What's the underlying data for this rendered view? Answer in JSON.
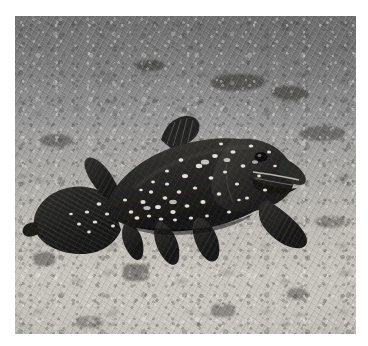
{
  "page": {
    "type": "photograph",
    "orientation": "landscape",
    "color_mode": "grayscale",
    "background_color": "#ffffff"
  },
  "photo": {
    "alt": "Black-and-white underwater photograph of a coelacanth fish hovering just above a bright sandy, rubble-strewn seafloor",
    "frame": {
      "left": 15,
      "top": 16,
      "width": 341,
      "height": 318,
      "border_color": "#ffffff"
    },
    "scene": {
      "setting": "underwater seafloor",
      "water_tone": "#6f6f6f",
      "midground_tone": "#a8a6a2",
      "seabed_tone": "#c9c6bf",
      "lighting": "diffuse overhead light, brighter toward the lower foreground"
    },
    "subject": {
      "name": "coelacanth",
      "common_label": "Coelacanth (Latimeria)",
      "body_color": "#2a2926",
      "marking_color": "#f0efe9",
      "markings": "irregular white speckles and blotches across the flank and head",
      "facing": "right",
      "position": "center-left of frame",
      "features": [
        {
          "label": "head",
          "detail": "large blunt head with a heavy jaw, facing right"
        },
        {
          "label": "eye",
          "detail": "small dark eye high on the head"
        },
        {
          "label": "mouth",
          "detail": "pale jaw line running forward to the snout"
        },
        {
          "label": "first-dorsal-fin",
          "detail": "small spiny dorsal fin on the upper back"
        },
        {
          "label": "second-dorsal-fin",
          "detail": "lobed fin set far back on the body"
        },
        {
          "label": "pectoral-fin",
          "detail": "dark fan-shaped lobed fin extending down and back"
        },
        {
          "label": "pelvic-fins",
          "detail": "two paddle-like lobed fins hanging beneath the belly"
        },
        {
          "label": "anal-fin",
          "detail": "lobed fin just ahead of the tail"
        },
        {
          "label": "caudal-fin",
          "detail": "three-lobed diphycercal tail with visible fin rays"
        }
      ]
    },
    "seafloor": {
      "description": "coarse pale sand strewn with coral rubble and dark stones",
      "texture": "granular with scattered dark pebbles and bright shell fragments"
    }
  }
}
